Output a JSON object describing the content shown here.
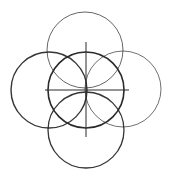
{
  "diagram": {
    "stroke_color": "#2a2a2a",
    "background": "#ffffff",
    "circles": [
      {
        "name": "top",
        "cx": 85,
        "cy": 50,
        "r": 38,
        "stroke_width": 0.9,
        "opacity": 0.8
      },
      {
        "name": "left",
        "cx": 49,
        "cy": 90,
        "r": 38,
        "stroke_width": 1.4,
        "opacity": 0.95
      },
      {
        "name": "center",
        "cx": 86,
        "cy": 90,
        "r": 38,
        "stroke_width": 1.6,
        "opacity": 1
      },
      {
        "name": "right",
        "cx": 123,
        "cy": 89,
        "r": 38,
        "stroke_width": 0.9,
        "opacity": 0.75
      },
      {
        "name": "bottom",
        "cx": 86,
        "cy": 130,
        "r": 38,
        "stroke_width": 1.3,
        "opacity": 0.95
      }
    ],
    "crosshair": {
      "horizontal": {
        "x1": 45,
        "y1": 90,
        "x2": 129,
        "y2": 90
      },
      "vertical": {
        "x1": 86,
        "y1": 42,
        "x2": 86,
        "y2": 137
      }
    }
  }
}
